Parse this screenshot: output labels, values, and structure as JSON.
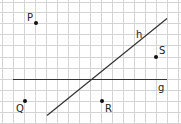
{
  "grid": {
    "color": "#d4d4d4",
    "x_lines": [
      2,
      13,
      24,
      35,
      46,
      57,
      68,
      79,
      90,
      101,
      112,
      123,
      134,
      145,
      156,
      167,
      178
    ],
    "y_lines": [
      2,
      12,
      23,
      34,
      45,
      57,
      68,
      79,
      90,
      101,
      112,
      123
    ]
  },
  "lines": [
    {
      "name": "g",
      "label": "g",
      "x1": 13,
      "y1": 79,
      "x2": 167,
      "y2": 79,
      "label_x": 158,
      "label_y": 91,
      "color": "#333333"
    },
    {
      "name": "h",
      "label": "h",
      "x1": 47,
      "y1": 115,
      "x2": 167,
      "y2": 18,
      "label_x": 136,
      "label_y": 38,
      "color": "#333333"
    }
  ],
  "points": [
    {
      "name": "P",
      "label": "P",
      "x": 36,
      "y": 23,
      "label_x": 27,
      "label_y": 21
    },
    {
      "name": "S",
      "label": "S",
      "x": 156,
      "y": 57,
      "label_x": 159,
      "label_y": 54
    },
    {
      "name": "Q",
      "label": "Q",
      "x": 25,
      "y": 101,
      "label_x": 16,
      "label_y": 112
    },
    {
      "name": "R",
      "label": "R",
      "x": 102,
      "y": 101,
      "label_x": 105,
      "label_y": 112
    }
  ]
}
